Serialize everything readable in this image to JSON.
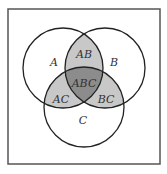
{
  "diagram": {
    "type": "venn",
    "sets": [
      "A",
      "B",
      "C"
    ],
    "frame": {
      "x": 8,
      "y": 9,
      "width": 152,
      "height": 155,
      "stroke": "#555555"
    },
    "circles": [
      {
        "name": "A",
        "cx": 63,
        "cy": 68,
        "r": 40
      },
      {
        "name": "B",
        "cx": 105,
        "cy": 68,
        "r": 40
      },
      {
        "name": "C",
        "cx": 84,
        "cy": 107,
        "r": 40
      }
    ],
    "colors": {
      "pairwise_fill": "#c8c8c8",
      "triple_fill": "#8c8c8c",
      "stroke": "#222222",
      "background": "#ffffff"
    },
    "labels": {
      "A": {
        "text": "A",
        "x": 54,
        "y": 66
      },
      "B": {
        "text": "B",
        "x": 110,
        "y": 63
      },
      "C": {
        "text": "C",
        "x": 81,
        "y": 122
      },
      "AB": {
        "text": "AB",
        "x": 84,
        "y": 57
      },
      "AC": {
        "text": "AC",
        "x": 60,
        "y": 101
      },
      "BC": {
        "text": "BC",
        "x": 105,
        "y": 101
      },
      "ABC": {
        "text": "ABC",
        "x": 84,
        "y": 86
      }
    }
  }
}
